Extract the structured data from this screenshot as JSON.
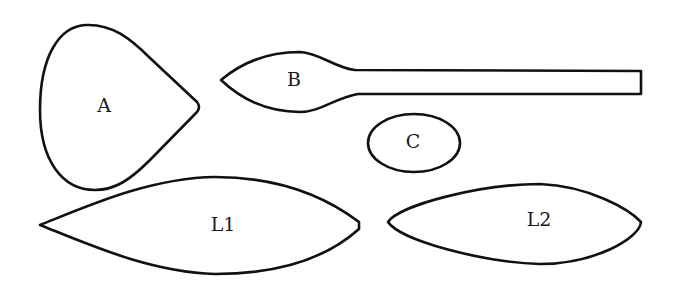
{
  "diagram": {
    "shapes": [
      {
        "id": "A",
        "label": "A",
        "kind": "teardrop"
      },
      {
        "id": "B",
        "label": "B",
        "kind": "spoon"
      },
      {
        "id": "C",
        "label": "C",
        "kind": "ellipse"
      },
      {
        "id": "L1",
        "label": "L1",
        "kind": "leaf"
      },
      {
        "id": "L2",
        "label": "L2",
        "kind": "leaf"
      }
    ]
  }
}
